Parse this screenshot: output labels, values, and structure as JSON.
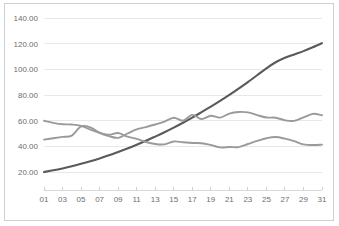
{
  "chart_data": {
    "type": "line",
    "title": "",
    "subtitle": "",
    "xlabel": "",
    "ylabel": "",
    "grid": "horizontal",
    "legend": "none",
    "ylim": [
      0,
      140
    ],
    "yticks": [
      20,
      40,
      60,
      80,
      100,
      120,
      140
    ],
    "ytick_labels": [
      "20.00",
      "40.00",
      "60.00",
      "80.00",
      "100.00",
      "120.00",
      "140.00"
    ],
    "x": [
      1,
      2,
      3,
      4,
      5,
      6,
      7,
      8,
      9,
      10,
      11,
      12,
      13,
      14,
      15,
      16,
      17,
      18,
      19,
      20,
      21,
      22,
      23,
      24,
      25,
      26,
      27,
      28,
      29,
      30,
      31
    ],
    "xtick_labels": [
      "01",
      "",
      "03",
      "",
      "05",
      "",
      "07",
      "",
      "09",
      "",
      "11",
      "",
      "13",
      "",
      "15",
      "",
      "17",
      "",
      "19",
      "",
      "21",
      "",
      "23",
      "",
      "25",
      "",
      "27",
      "",
      "29",
      "",
      "31"
    ],
    "xtick_labels_shown": [
      "01",
      "03",
      "05",
      "07",
      "09",
      "11",
      "13",
      "15",
      "17",
      "19",
      "21",
      "23",
      "25",
      "27",
      "29",
      "31"
    ],
    "series": [
      {
        "name": "Series 1",
        "color": "#5a5a5a",
        "width": 2.1,
        "values": [
          20.0,
          21.3,
          22.8,
          24.5,
          26.4,
          28.4,
          30.6,
          33.0,
          35.6,
          38.3,
          41.2,
          44.3,
          47.6,
          51.0,
          54.6,
          58.4,
          62.4,
          66.6,
          70.9,
          75.4,
          80.1,
          85.0,
          90.1,
          95.4,
          100.8,
          105.5,
          109.0,
          111.6,
          114.2,
          117.2,
          120.4
        ]
      },
      {
        "name": "Series 2",
        "color": "#9a9a9a",
        "width": 1.9,
        "values": [
          59.9,
          58.3,
          57.2,
          57.0,
          56.0,
          53.0,
          50.6,
          49.0,
          50.4,
          47.5,
          45.8,
          43.4,
          41.8,
          41.5,
          43.8,
          43.2,
          42.6,
          42.4,
          41.0,
          39.2,
          39.5,
          39.4,
          41.8,
          44.2,
          46.3,
          47.3,
          46.0,
          44.0,
          41.5,
          41.0,
          41.3
        ]
      },
      {
        "name": "Series 3",
        "color": "#9a9a9a",
        "width": 1.9,
        "values": [
          45.2,
          46.3,
          47.4,
          48.4,
          55.5,
          54.7,
          50.5,
          48.0,
          46.6,
          50.0,
          53.2,
          55.0,
          57.0,
          59.2,
          62.3,
          60.0,
          64.5,
          61.3,
          63.8,
          62.4,
          65.5,
          66.8,
          66.5,
          64.3,
          62.5,
          62.3,
          60.3,
          59.8,
          62.5,
          65.3,
          64.2
        ]
      }
    ]
  }
}
